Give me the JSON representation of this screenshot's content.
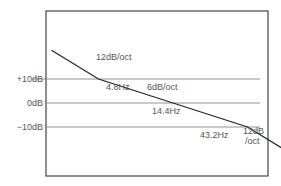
{
  "chart_data": {
    "type": "line",
    "title": "",
    "xlabel": "",
    "ylabel": "",
    "axis_scale": "log-frequency (octaves) vs level (dB)",
    "y_reference_lines": [
      {
        "label": "+10dB",
        "value": 10
      },
      {
        "label": "0dB",
        "value": 0
      },
      {
        "label": "−10dB",
        "value": -10
      }
    ],
    "breakpoints": [
      {
        "label": "4.8Hz",
        "freq_hz": 4.8,
        "level_db": 10
      },
      {
        "label": "14.4Hz",
        "freq_hz": 14.4,
        "level_db": 0
      },
      {
        "label": "43.2Hz",
        "freq_hz": 43.2,
        "level_db": -10
      }
    ],
    "segments": [
      {
        "label": "12dB/oct",
        "slope_db_per_oct": -12,
        "range": "below 4.8Hz"
      },
      {
        "label": "6dB/oct",
        "slope_db_per_oct": -6,
        "range": "4.8Hz to 43.2Hz"
      },
      {
        "label": "12dB\n/oct",
        "line1": "12dB",
        "line2": "/oct",
        "slope_db_per_oct": -12,
        "range": "above 43.2Hz"
      }
    ],
    "series": [
      {
        "name": "response",
        "points_db": [
          {
            "freq_hz": 2.4,
            "db": 22
          },
          {
            "freq_hz": 4.8,
            "db": 10
          },
          {
            "freq_hz": 14.4,
            "db": 0
          },
          {
            "freq_hz": 43.2,
            "db": -10
          },
          {
            "freq_hz": 86.4,
            "db": -22
          }
        ]
      }
    ],
    "grid": false
  }
}
